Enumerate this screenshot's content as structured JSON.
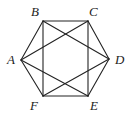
{
  "figure": {
    "name": "hexagon-with-inscribed-star",
    "canvas": {
      "width": 130,
      "height": 117
    },
    "style": {
      "background_color": "#ffffff",
      "line_color": "#232323",
      "line_width": 1.1,
      "label_color": "#1c1c1c"
    },
    "vertices": [
      {
        "id": "A",
        "label": "A",
        "x": 21,
        "y": 60,
        "label_x": 7,
        "label_y": 53
      },
      {
        "id": "B",
        "label": "B",
        "x": 43,
        "y": 21,
        "label_x": 31,
        "label_y": 5
      },
      {
        "id": "C",
        "label": "C",
        "x": 88,
        "y": 21,
        "label_x": 89,
        "label_y": 5
      },
      {
        "id": "D",
        "label": "D",
        "x": 109,
        "y": 59,
        "label_x": 115,
        "label_y": 53
      },
      {
        "id": "E",
        "label": "E",
        "x": 88,
        "y": 96,
        "label_x": 90,
        "label_y": 99
      },
      {
        "id": "F",
        "label": "F",
        "x": 43,
        "y": 96,
        "label_x": 30,
        "label_y": 99
      }
    ],
    "edges": [
      {
        "name": "edge-A-B",
        "from": "A",
        "to": "B",
        "kind": "hexagon-side"
      },
      {
        "name": "edge-B-C",
        "from": "B",
        "to": "C",
        "kind": "hexagon-side"
      },
      {
        "name": "edge-C-D",
        "from": "C",
        "to": "D",
        "kind": "hexagon-side"
      },
      {
        "name": "edge-D-E",
        "from": "D",
        "to": "E",
        "kind": "hexagon-side"
      },
      {
        "name": "edge-E-F",
        "from": "E",
        "to": "F",
        "kind": "hexagon-side"
      },
      {
        "name": "edge-F-A",
        "from": "F",
        "to": "A",
        "kind": "hexagon-side"
      },
      {
        "name": "chord-A-C",
        "from": "A",
        "to": "C",
        "kind": "short-diagonal"
      },
      {
        "name": "chord-C-E",
        "from": "C",
        "to": "E",
        "kind": "short-diagonal"
      },
      {
        "name": "chord-E-A",
        "from": "E",
        "to": "A",
        "kind": "short-diagonal"
      },
      {
        "name": "chord-B-D",
        "from": "B",
        "to": "D",
        "kind": "short-diagonal"
      },
      {
        "name": "chord-D-F",
        "from": "D",
        "to": "F",
        "kind": "short-diagonal"
      },
      {
        "name": "chord-F-B",
        "from": "F",
        "to": "B",
        "kind": "short-diagonal"
      }
    ]
  }
}
